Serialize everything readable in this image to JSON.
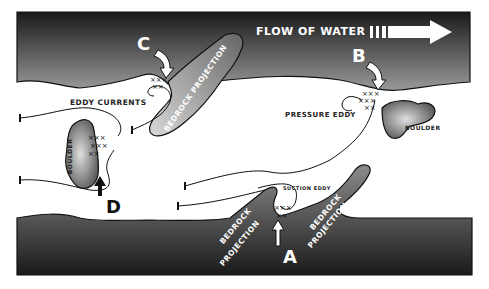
{
  "diagram": {
    "title": "Flow of Water",
    "flow_label": "FLOW OF WATER",
    "markers": {
      "A": "A",
      "B": "B",
      "C": "C",
      "D": "D"
    },
    "labels": {
      "eddy_currents": "EDDY CURRENTS",
      "pressure_eddy": "PRESSURE EDDY",
      "suction_eddy": "SUCTION EDDY",
      "boulder_left": "BOULDER",
      "boulder_right": "BOULDER",
      "bedrock_top": "BEDROCK PROJECTION",
      "bedrock_bottom_left_1": "BEDROCK",
      "bedrock_bottom_left_2": "PROJECTION",
      "bedrock_bottom_right_1": "BEDROCK",
      "bedrock_bottom_right_2": "PROJECTION"
    },
    "colors": {
      "rock_dark": "#2a2a2a",
      "rock_light": "#c8c8c8",
      "water": "#ffffff",
      "text_light": "#ffffff",
      "text_dark": "#222222"
    }
  }
}
